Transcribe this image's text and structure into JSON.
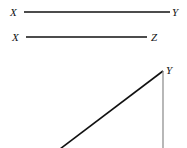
{
  "diagram": {
    "segment_xy": {
      "start_label": "X",
      "end_label": "Y"
    },
    "segment_xz": {
      "start_label": "X",
      "end_label": "Z"
    },
    "triangle": {
      "apex_label": "Y"
    }
  }
}
